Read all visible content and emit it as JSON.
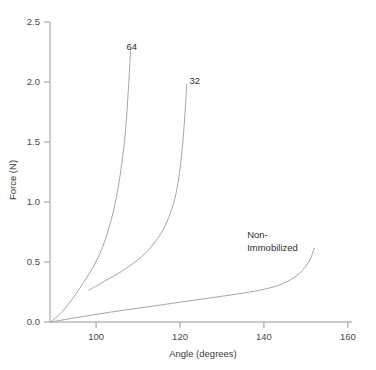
{
  "chart_data": {
    "type": "line",
    "title": "",
    "xlabel": "Angle (degrees)",
    "ylabel": "Force (N)",
    "xlim": [
      89,
      161
    ],
    "ylim": [
      0.0,
      2.5
    ],
    "xticks": [
      "100",
      "120",
      "140",
      "160"
    ],
    "xtick_values": [
      100,
      120,
      140,
      160
    ],
    "yticks": [
      "0.0",
      "0.5",
      "1.0",
      "1.5",
      "2.0",
      "2.5"
    ],
    "ytick_values": [
      0.0,
      0.5,
      1.0,
      1.5,
      2.0,
      2.5
    ],
    "grid": false,
    "legend_position": "inline-annotations",
    "line_color": "#a6a6a6",
    "axis_color": "#9a9a9a",
    "series": [
      {
        "name": "64",
        "label": "64",
        "label_x": 108.5,
        "label_y": 2.27,
        "points": [
          [
            89.2,
            0.0
          ],
          [
            92.0,
            0.09
          ],
          [
            94.5,
            0.2
          ],
          [
            97.0,
            0.33
          ],
          [
            99.5,
            0.47
          ],
          [
            101.5,
            0.62
          ],
          [
            103.0,
            0.78
          ],
          [
            104.3,
            0.95
          ],
          [
            105.3,
            1.13
          ],
          [
            106.1,
            1.32
          ],
          [
            106.8,
            1.52
          ],
          [
            107.3,
            1.73
          ],
          [
            107.7,
            1.95
          ],
          [
            108.0,
            2.12
          ],
          [
            108.2,
            2.27
          ]
        ]
      },
      {
        "name": "32",
        "label": "32",
        "label_x": 123.5,
        "label_y": 1.98,
        "points": [
          [
            98.3,
            0.265
          ],
          [
            102.0,
            0.34
          ],
          [
            106.0,
            0.42
          ],
          [
            110.0,
            0.52
          ],
          [
            113.0,
            0.62
          ],
          [
            115.5,
            0.74
          ],
          [
            117.3,
            0.87
          ],
          [
            118.7,
            1.02
          ],
          [
            119.7,
            1.2
          ],
          [
            120.4,
            1.4
          ],
          [
            120.9,
            1.6
          ],
          [
            121.3,
            1.8
          ],
          [
            121.6,
            1.98
          ]
        ]
      },
      {
        "name": "Non-Immobilized",
        "label": "Non-Immobilized",
        "label_line1": "Non-",
        "label_line2": "Immobilized",
        "label_x": 136.0,
        "label_y": 0.7,
        "points": [
          [
            89.2,
            0.0
          ],
          [
            95.0,
            0.035
          ],
          [
            103.0,
            0.08
          ],
          [
            112.0,
            0.125
          ],
          [
            120.0,
            0.165
          ],
          [
            128.0,
            0.205
          ],
          [
            134.0,
            0.235
          ],
          [
            139.0,
            0.265
          ],
          [
            143.0,
            0.3
          ],
          [
            146.0,
            0.345
          ],
          [
            148.3,
            0.4
          ],
          [
            150.0,
            0.465
          ],
          [
            151.2,
            0.535
          ],
          [
            152.0,
            0.615
          ]
        ]
      }
    ]
  },
  "caption": {
    "partial_text": ""
  }
}
